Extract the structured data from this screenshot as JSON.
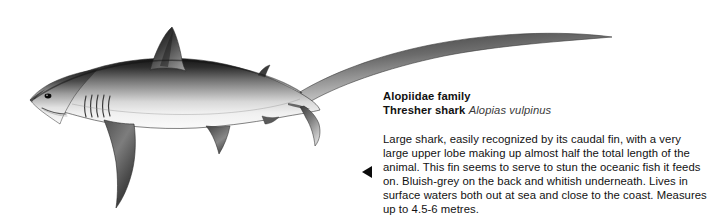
{
  "page": {
    "background_color": "#ffffff",
    "width": 711,
    "height": 221
  },
  "illustration": {
    "subject": "thresher-shark",
    "style": "grayscale-scientific-illustration",
    "description_alt": "Side view of a thresher shark with an extremely long upper caudal lobe sweeping to the upper right",
    "tones": {
      "dorsal_dark": "#1c1c1c",
      "mid_grey": "#7e7e7e",
      "belly_light": "#f2f2f2",
      "outline": "#2a2a2a"
    }
  },
  "marker": {
    "icon": "left-pointing-triangle-icon",
    "color": "#0b0b0b"
  },
  "heading": {
    "family_line": "Alopiidae family",
    "common_name": "Thresher shark",
    "scientific_name": "Alopias vulpinus"
  },
  "body": {
    "text": "Large shark, easily recognized by its caudal fin, with a very large upper lobe making up almost half the total length of the animal. This fin seems to serve to stun the oceanic fish it feeds on. Bluish-grey on the back and whitish underneath. Lives in surface waters both out at sea and close to the coast. Measures up to 4.5-6 metres."
  }
}
